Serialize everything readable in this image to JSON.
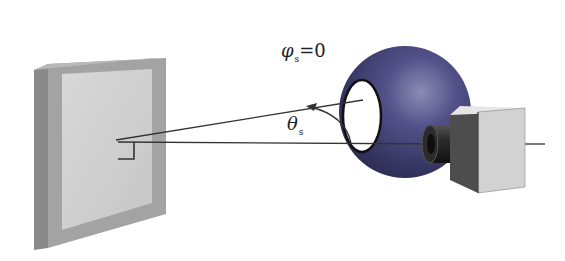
{
  "diagram": {
    "type": "measurement-setup",
    "components": {
      "target_panel": {
        "name": "Target sample panel",
        "frame_color": "#9a9a9a",
        "face_color": "#cdcdcd"
      },
      "integrating_sphere": {
        "name": "Sphere",
        "color": "#3f3f72",
        "port_color": "#ffffff"
      },
      "camera": {
        "name": "Camera",
        "body_color": "#d4d4d4",
        "side_color": "#4a4a4a",
        "lens_color": "#1f1f1f"
      }
    },
    "labels": {
      "phi": {
        "symbol": "φ",
        "subscript": "s",
        "equals": "=0"
      },
      "theta": {
        "symbol": "θ",
        "subscript": "s"
      }
    },
    "colors": {
      "line": "#333333",
      "background": "#ffffff"
    }
  }
}
